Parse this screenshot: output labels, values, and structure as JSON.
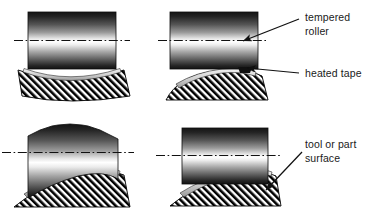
{
  "figure": {
    "name": "roller-tape-compaction-diagram",
    "background_color": "#ffffff",
    "line_color": "#111111",
    "hatch_color": "#000000",
    "roller_dark": "#141414",
    "roller_light": "#ffffff",
    "tape_color": "#d8d8d8"
  },
  "annotations": [
    {
      "id": "tempered-roller",
      "line1": "tempered",
      "line2": "roller",
      "points_to": "roller-centerline-panel-top-right"
    },
    {
      "id": "heated-tape",
      "line1": "heated tape",
      "line2": "",
      "points_to": "tape-layer-panel-top-right"
    },
    {
      "id": "tool-or-part-surface",
      "line1": "tool or part",
      "line2": "surface",
      "points_to": "part-surface-panel-bottom-right"
    }
  ],
  "panels": [
    {
      "id": "panel-top-left",
      "position": "top-left",
      "roller_type": "straight-cylindrical-roller",
      "roller_edge": "flat",
      "part_surface": "concave",
      "has_centerline": true,
      "has_tape": true,
      "arrows": 0
    },
    {
      "id": "panel-top-right",
      "position": "top-right",
      "roller_type": "straight-cylindrical-roller",
      "roller_edge": "flat",
      "part_surface": "convex",
      "has_centerline": true,
      "has_tape": true,
      "arrows": 2
    },
    {
      "id": "panel-bottom-left",
      "position": "bottom-left",
      "roller_type": "segmented-compliant-roller",
      "roller_edge": "stepped-arc",
      "part_surface": "convex",
      "has_centerline": true,
      "has_tape": true,
      "arrows": 0
    },
    {
      "id": "panel-bottom-right",
      "position": "bottom-right",
      "roller_type": "straight-cylindrical-roller",
      "roller_edge": "flat",
      "part_surface": "convex",
      "has_centerline": true,
      "has_tape": true,
      "arrows": 1
    }
  ]
}
